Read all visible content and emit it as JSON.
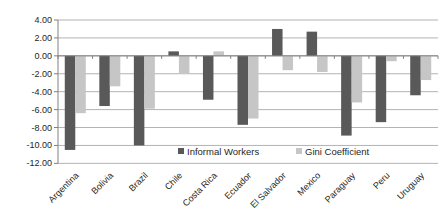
{
  "chart_data": {
    "type": "bar",
    "title": "",
    "categories": [
      "Argentina",
      "Bolivia",
      "Brazil",
      "Chile",
      "Costa Rica",
      "Ecuador",
      "El Salvador",
      "Mexico",
      "Paraguay",
      "Peru",
      "Uruguay"
    ],
    "series": [
      {
        "name": "Informal Workers",
        "color": "#595959",
        "values": [
          -10.5,
          -5.6,
          -10.0,
          0.5,
          -4.9,
          -7.7,
          3.0,
          2.7,
          -8.9,
          -7.4,
          -4.4
        ]
      },
      {
        "name": "Gini Coefficient",
        "color": "#c6c6c6",
        "values": [
          -6.4,
          -3.4,
          -5.9,
          -2.0,
          0.5,
          -7.0,
          -1.6,
          -1.8,
          -5.2,
          -0.6,
          -2.7
        ]
      }
    ],
    "ylim": [
      -12,
      4
    ],
    "ytick_step": 2,
    "ytick_labels": [
      "4.00",
      "2.00",
      "0.00",
      "-2.00",
      "-4.00",
      "-6.00",
      "-8.00",
      "-10.00",
      "-12.00"
    ],
    "xlabel": "",
    "ylabel": "",
    "grid": true,
    "legend_position": "bottom-inside",
    "colors": {
      "background": "#ffffff",
      "gridline": "#b3b3b3",
      "axis_line": "#808080",
      "tick": "#808080",
      "axis_text": "#262626",
      "legend_text": "#262626",
      "informal_workers_bar": "#595959",
      "gini_coefficient_bar": "#c6c6c6"
    }
  }
}
